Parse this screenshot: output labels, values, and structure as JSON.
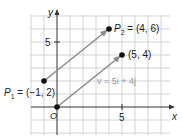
{
  "diagram": {
    "type": "coordinate-plane-vectors",
    "axes": {
      "x_label": "x",
      "y_label": "y",
      "origin_label": "O",
      "x_tick_label": "5",
      "y_tick_label": "5"
    },
    "points": [
      {
        "name": "P1",
        "label_prefix": "P",
        "label_sub": "1",
        "label_rest": " = (−1, 2)",
        "x": -1,
        "y": 2
      },
      {
        "name": "P2",
        "label_prefix": "P",
        "label_sub": "2",
        "label_rest": " = (4, 6)",
        "x": 4,
        "y": 6
      },
      {
        "name": "A",
        "label": "(5, 4)",
        "x": 5,
        "y": 4
      },
      {
        "name": "O",
        "x": 0,
        "y": 0
      }
    ],
    "vectors": [
      {
        "from": "P1",
        "to": "P2"
      },
      {
        "from": "O",
        "to": "A"
      }
    ],
    "vector_label": "v = 5i + 4j",
    "colors": {
      "grid": "#c8c8c8",
      "axis": "#333333",
      "vector": "#8c8c8c",
      "point": "#111111",
      "vector_label": "#9a9a9a"
    }
  }
}
